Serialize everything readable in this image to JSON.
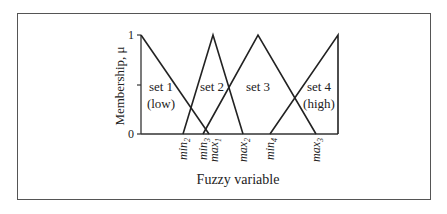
{
  "diagram": {
    "y_axis_label": "Membership, μ",
    "x_axis_label": "Fuzzy variable",
    "y_ticks": [
      "1",
      "0"
    ],
    "sets": [
      {
        "name": "set 1",
        "sub": "(low)"
      },
      {
        "name": "set 2",
        "sub": ""
      },
      {
        "name": "set 3",
        "sub": ""
      },
      {
        "name": "set 4",
        "sub": "(high)"
      }
    ],
    "x_markers": [
      {
        "base": "min",
        "sub": "2"
      },
      {
        "base": "min",
        "sub": "3"
      },
      {
        "base": "max",
        "sub": "1"
      },
      {
        "base": "max",
        "sub": "2"
      },
      {
        "base": "min",
        "sub": "4"
      },
      {
        "base": "max",
        "sub": "3"
      }
    ]
  }
}
